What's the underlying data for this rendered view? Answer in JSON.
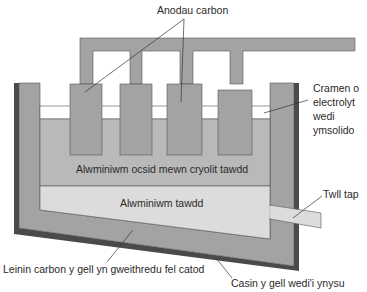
{
  "diagram": {
    "colors": {
      "carbon": "#a3a3a3",
      "electrolyte": "#b9b9b9",
      "aluminium": "#dcdcdc",
      "crust": "#ffffff",
      "casing": "#4a4a4a",
      "outline": "#555555",
      "leader": "#333333"
    },
    "labels": {
      "anodes": "Anodau carbon",
      "crust_line1": "Cramen o",
      "crust_line2": "electrolyt",
      "crust_line3": "wedi",
      "crust_line4": "ymsolido",
      "electrolyte": "Alwminiwm ocsid mewn cryolit tawdd",
      "aluminium": "Alwminiwm tawdd",
      "tap_hole": "Twll tap",
      "lining": "Leinin carbon y gell yn gweithredu fel catod",
      "casing": "Casin y gell wedi'i ynysu"
    }
  }
}
